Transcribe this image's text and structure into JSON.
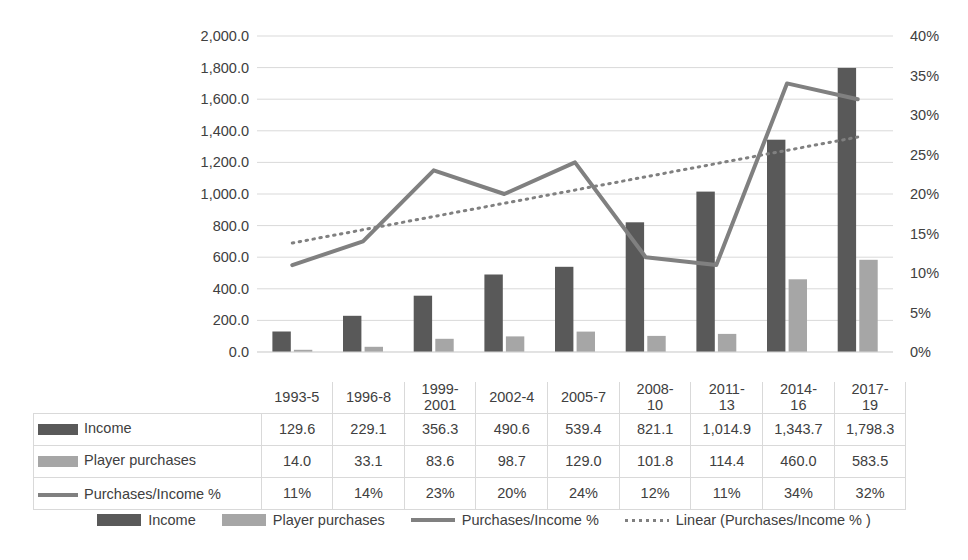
{
  "chart_data": {
    "type": "bar",
    "title": "",
    "xlabel": "",
    "ylabel": "",
    "grid": true,
    "legend_position": "bottom",
    "categories": [
      "1993-5",
      "1996-8",
      "1999-2001",
      "2002-4",
      "2005-7",
      "2008-10",
      "2011-13",
      "2014-16",
      "2017-19"
    ],
    "category_lines": [
      {
        "l1": "1993-5",
        "l2": ""
      },
      {
        "l1": "1996-8",
        "l2": ""
      },
      {
        "l1": "1999-",
        "l2": "2001"
      },
      {
        "l1": "2002-4",
        "l2": ""
      },
      {
        "l1": "2005-7",
        "l2": ""
      },
      {
        "l1": "2008-",
        "l2": "10"
      },
      {
        "l1": "2011-",
        "l2": "13"
      },
      {
        "l1": "2014-",
        "l2": "16"
      },
      {
        "l1": "2017-",
        "l2": "19"
      }
    ],
    "series": [
      {
        "name": "Income",
        "type": "bar",
        "axis": "left",
        "color": "#595959",
        "values": [
          129.6,
          229.1,
          356.3,
          490.6,
          539.4,
          821.1,
          1014.9,
          1343.7,
          1798.3
        ],
        "labels": [
          "129.6",
          "229.1",
          "356.3",
          "490.6",
          "539.4",
          "821.1",
          "1,014.9",
          "1,343.7",
          "1,798.3"
        ]
      },
      {
        "name": "Player purchases",
        "type": "bar",
        "axis": "left",
        "color": "#a6a6a6",
        "values": [
          14.0,
          33.1,
          83.6,
          98.7,
          129.0,
          101.8,
          114.4,
          460.0,
          583.5
        ],
        "labels": [
          "14.0",
          "33.1",
          "83.6",
          "98.7",
          "129.0",
          "101.8",
          "114.4",
          "460.0",
          "583.5"
        ]
      },
      {
        "name": "Purchases/Income %",
        "type": "line",
        "axis": "right",
        "color": "#808080",
        "values": [
          11,
          14,
          23,
          20,
          24,
          12,
          11,
          34,
          32
        ],
        "labels": [
          "11%",
          "14%",
          "23%",
          "20%",
          "24%",
          "12%",
          "11%",
          "34%",
          "32%"
        ]
      },
      {
        "name": "Linear (Purchases/Income % )",
        "type": "trendline",
        "axis": "right",
        "color": "#808080",
        "style": "dotted",
        "endpoints": [
          13.8,
          27.2
        ]
      }
    ],
    "y_left": {
      "min": 0,
      "max": 2000,
      "step": 200,
      "ticks": [
        "0.0",
        "200.0",
        "400.0",
        "600.0",
        "800.0",
        "1,000.0",
        "1,200.0",
        "1,400.0",
        "1,600.0",
        "1,800.0",
        "2,000.0"
      ]
    },
    "y_right": {
      "min": 0,
      "max": 40,
      "step": 5,
      "ticks": [
        "0%",
        "5%",
        "10%",
        "15%",
        "20%",
        "25%",
        "30%",
        "35%",
        "40%"
      ]
    }
  },
  "table": {
    "rows": [
      {
        "label": "Income",
        "marker": "bar-dark"
      },
      {
        "label": "Player purchases",
        "marker": "bar-light"
      },
      {
        "label": "Purchases/Income %",
        "marker": "line"
      }
    ]
  },
  "legend": {
    "items": [
      {
        "label": "Income",
        "marker": "bar-dark"
      },
      {
        "label": "Player purchases",
        "marker": "bar-light"
      },
      {
        "label": "Purchases/Income %",
        "marker": "line"
      },
      {
        "label": "Linear (Purchases/Income % )",
        "marker": "dotted"
      }
    ]
  },
  "colors": {
    "income": "#595959",
    "player_purchases": "#a6a6a6",
    "ratio_line": "#808080",
    "gridline": "#d9d9d9",
    "text": "#404040"
  }
}
